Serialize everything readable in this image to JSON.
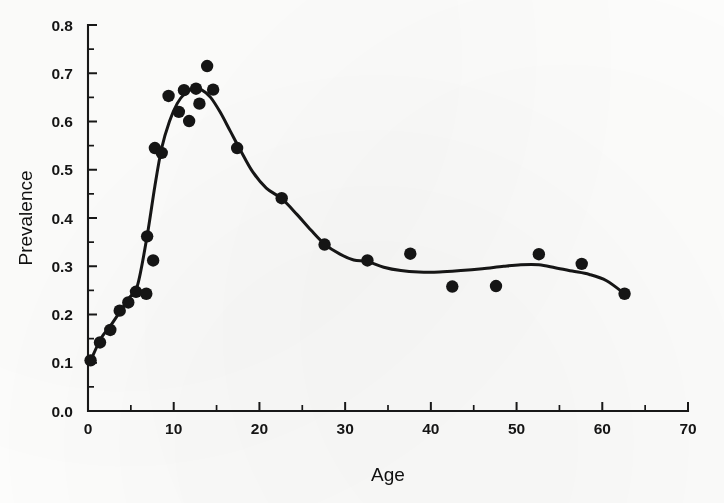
{
  "figure": {
    "background_color": "#fdfdfc",
    "ink_color": "#151515"
  },
  "chart_data": {
    "type": "scatter",
    "title": "",
    "subtitle": "",
    "xlabel": "Age",
    "ylabel": "Prevalence",
    "xlim": [
      0,
      70
    ],
    "ylim": [
      0.0,
      0.8
    ],
    "grid": false,
    "legend": null,
    "x_ticks": [
      0,
      10,
      20,
      30,
      40,
      50,
      60,
      70
    ],
    "x_tick_labels": [
      "0",
      "10",
      "20",
      "30",
      "40",
      "50",
      "60",
      "70"
    ],
    "x_minor_ticks": [
      5,
      15,
      25,
      35,
      45,
      55,
      65
    ],
    "y_ticks": [
      0.0,
      0.1,
      0.2,
      0.3,
      0.4,
      0.5,
      0.6,
      0.7,
      0.8
    ],
    "y_tick_labels": [
      "0.0",
      "0.1",
      "0.2",
      "0.3",
      "0.4",
      "0.5",
      "0.6",
      "0.7",
      "0.8"
    ],
    "y_minor_ticks": [
      0.05,
      0.15,
      0.25,
      0.35,
      0.45,
      0.55,
      0.65,
      0.75
    ],
    "series": [
      {
        "name": "Observed prevalence",
        "type": "scatter",
        "marker": "filled-circle",
        "marker_size": 6.2,
        "color": "#151515",
        "points": [
          [
            0.3,
            0.105
          ],
          [
            1.4,
            0.142
          ],
          [
            2.6,
            0.168
          ],
          [
            3.7,
            0.208
          ],
          [
            4.7,
            0.225
          ],
          [
            5.6,
            0.247
          ],
          [
            6.8,
            0.243
          ],
          [
            7.6,
            0.312
          ],
          [
            6.9,
            0.362
          ],
          [
            7.8,
            0.545
          ],
          [
            8.6,
            0.535
          ],
          [
            9.4,
            0.653
          ],
          [
            10.6,
            0.62
          ],
          [
            11.2,
            0.665
          ],
          [
            11.8,
            0.601
          ],
          [
            12.6,
            0.668
          ],
          [
            13.0,
            0.637
          ],
          [
            13.9,
            0.715
          ],
          [
            14.6,
            0.666
          ],
          [
            17.4,
            0.545
          ],
          [
            22.6,
            0.441
          ],
          [
            27.6,
            0.345
          ],
          [
            32.6,
            0.312
          ],
          [
            37.6,
            0.326
          ],
          [
            42.5,
            0.258
          ],
          [
            47.6,
            0.259
          ],
          [
            52.6,
            0.325
          ],
          [
            57.6,
            0.305
          ],
          [
            62.6,
            0.243
          ]
        ]
      },
      {
        "name": "Smoothed fit",
        "type": "line",
        "color": "#161616",
        "line_width": 3.0,
        "points": [
          [
            0.3,
            0.104
          ],
          [
            1.5,
            0.15
          ],
          [
            2.6,
            0.176
          ],
          [
            3.7,
            0.205
          ],
          [
            4.8,
            0.234
          ],
          [
            5.8,
            0.262
          ],
          [
            6.9,
            0.363
          ],
          [
            7.8,
            0.466
          ],
          [
            8.6,
            0.545
          ],
          [
            9.5,
            0.6
          ],
          [
            10.4,
            0.637
          ],
          [
            11.3,
            0.658
          ],
          [
            12.3,
            0.668
          ],
          [
            13.3,
            0.665
          ],
          [
            14.3,
            0.65
          ],
          [
            15.4,
            0.62
          ],
          [
            16.6,
            0.58
          ],
          [
            17.8,
            0.54
          ],
          [
            19.2,
            0.496
          ],
          [
            20.8,
            0.462
          ],
          [
            22.6,
            0.44
          ],
          [
            24.4,
            0.407
          ],
          [
            26.0,
            0.375
          ],
          [
            27.6,
            0.346
          ],
          [
            29.4,
            0.325
          ],
          [
            31.0,
            0.313
          ],
          [
            32.6,
            0.31
          ],
          [
            34.5,
            0.298
          ],
          [
            36.5,
            0.291
          ],
          [
            38.6,
            0.288
          ],
          [
            41.0,
            0.288
          ],
          [
            43.5,
            0.291
          ],
          [
            46.0,
            0.295
          ],
          [
            48.5,
            0.3
          ],
          [
            50.5,
            0.303
          ],
          [
            52.6,
            0.303
          ],
          [
            54.5,
            0.297
          ],
          [
            56.5,
            0.29
          ],
          [
            58.5,
            0.283
          ],
          [
            60.5,
            0.27
          ],
          [
            62.6,
            0.243
          ]
        ]
      }
    ]
  },
  "axes": {
    "x_axis_title": "Age",
    "y_axis_title": "Prevalence"
  }
}
